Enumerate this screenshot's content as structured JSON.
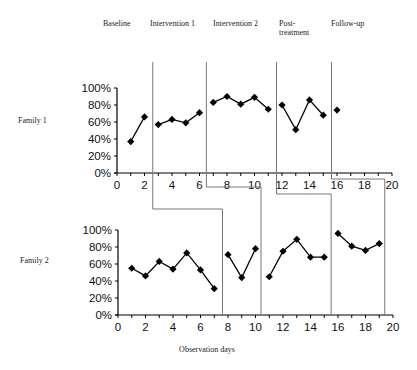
{
  "chart_data": [
    {
      "type": "line",
      "title": "Family 1",
      "xlabel": "",
      "ylabel": "",
      "xlim": [
        0,
        20
      ],
      "ylim": [
        0,
        100
      ],
      "xticks": [
        "0",
        "2",
        "4",
        "6",
        "8",
        "10",
        "12",
        "14",
        "16",
        "18",
        "20"
      ],
      "yticks": [
        "0%",
        "20%",
        "40%",
        "60%",
        "80%",
        "100%"
      ],
      "grid": false,
      "series": [
        {
          "name": "Baseline",
          "x": [
            1,
            2
          ],
          "values": [
            37,
            66
          ]
        },
        {
          "name": "Intervention 1",
          "x": [
            3,
            4,
            5,
            6
          ],
          "values": [
            57,
            63,
            59,
            71
          ]
        },
        {
          "name": "Intervention 2",
          "x": [
            7,
            8,
            9,
            10,
            11
          ],
          "values": [
            83,
            90,
            81,
            89,
            75
          ]
        },
        {
          "name": "Post-treatment",
          "x": [
            12,
            13,
            14,
            15
          ],
          "values": [
            80,
            51,
            86,
            68
          ]
        },
        {
          "name": "Follow-up",
          "x": [
            16
          ],
          "values": [
            74
          ]
        }
      ],
      "phase_changes": [
        2.6,
        6.5,
        11.6,
        15.6
      ]
    },
    {
      "type": "line",
      "title": "Family 2",
      "xlabel": "Observation days",
      "ylabel": "",
      "xlim": [
        0,
        20
      ],
      "ylim": [
        0,
        100
      ],
      "xticks": [
        "0",
        "2",
        "4",
        "6",
        "8",
        "10",
        "12",
        "14",
        "16",
        "18",
        "20"
      ],
      "yticks": [
        "0%",
        "20%",
        "40%",
        "60%",
        "80%",
        "100%"
      ],
      "grid": false,
      "series": [
        {
          "name": "Baseline",
          "x": [
            1,
            2,
            3,
            4,
            5,
            6,
            7
          ],
          "values": [
            55,
            46,
            63,
            54,
            73,
            53,
            31
          ]
        },
        {
          "name": "Intervention 1",
          "x": [
            8,
            9,
            10
          ],
          "values": [
            71,
            44,
            78
          ]
        },
        {
          "name": "Intervention 2",
          "x": [
            11,
            12,
            13,
            14,
            15
          ],
          "values": [
            45,
            75,
            89,
            68,
            68
          ]
        },
        {
          "name": "Follow-up",
          "x": [
            16,
            17,
            18,
            19
          ],
          "values": [
            96,
            81,
            76,
            84
          ]
        }
      ],
      "phase_changes": [
        7.6,
        10.4,
        15.5,
        19.4
      ]
    }
  ],
  "labels": {
    "phases": [
      "Baseline",
      "Intervention 1",
      "Intervention 2",
      "Post-",
      "treatment",
      "Follow-up"
    ],
    "family1": "Family 1",
    "family2": "Family 2",
    "xaxis": "Observation days"
  }
}
